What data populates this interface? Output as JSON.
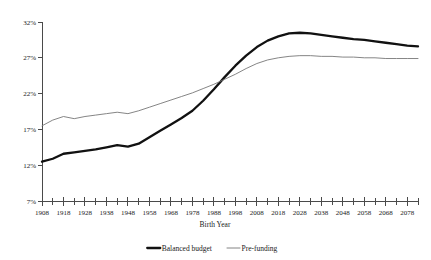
{
  "chart_data": {
    "type": "line",
    "title": "",
    "xlabel": "Birth Year",
    "ylabel": "",
    "xlim": [
      1908,
      2083
    ],
    "ylim": [
      7,
      32
    ],
    "grid": false,
    "legend_position": "bottom",
    "y_tick_labels": [
      "32%",
      "27%",
      "22%",
      "17%",
      "12%",
      "7%"
    ],
    "y_ticks": [
      32,
      27,
      22,
      17,
      12,
      7
    ],
    "x_tick_labels": [
      "1908",
      "1918",
      "1928",
      "1938",
      "1948",
      "1958",
      "1968",
      "1978",
      "1988",
      "1998",
      "2008",
      "2018",
      "2028",
      "2038",
      "2048",
      "2058",
      "2068",
      "2078"
    ],
    "x_ticks_major": [
      1908,
      1918,
      1928,
      1938,
      1948,
      1958,
      1968,
      1978,
      1988,
      1998,
      2008,
      2018,
      2028,
      2038,
      2048,
      2058,
      2068,
      2078
    ],
    "x_minor_step": 5,
    "x": [
      1908,
      1913,
      1918,
      1923,
      1928,
      1933,
      1938,
      1943,
      1948,
      1953,
      1958,
      1963,
      1968,
      1973,
      1978,
      1983,
      1988,
      1993,
      1998,
      2003,
      2008,
      2013,
      2018,
      2023,
      2028,
      2033,
      2038,
      2043,
      2048,
      2053,
      2058,
      2063,
      2068,
      2073,
      2078,
      2083
    ],
    "series": [
      {
        "name": "Balanced budget",
        "color": "#111111",
        "width": "thick",
        "values": [
          12.5,
          12.9,
          13.6,
          13.8,
          14.0,
          14.2,
          14.5,
          14.8,
          14.6,
          15.0,
          15.9,
          16.8,
          17.7,
          18.6,
          19.6,
          21.0,
          22.6,
          24.3,
          25.9,
          27.3,
          28.5,
          29.4,
          30.0,
          30.4,
          30.5,
          30.4,
          30.2,
          30.0,
          29.8,
          29.6,
          29.5,
          29.3,
          29.1,
          28.9,
          28.7,
          28.6
        ]
      },
      {
        "name": "Pre-funding",
        "color": "#777777",
        "width": "thin",
        "values": [
          17.5,
          18.3,
          18.8,
          18.5,
          18.8,
          19.0,
          19.2,
          19.4,
          19.2,
          19.6,
          20.1,
          20.6,
          21.1,
          21.6,
          22.1,
          22.7,
          23.3,
          24.0,
          24.7,
          25.5,
          26.2,
          26.7,
          27.0,
          27.2,
          27.3,
          27.3,
          27.2,
          27.2,
          27.1,
          27.1,
          27.0,
          27.0,
          26.9,
          26.9,
          26.9,
          26.9
        ]
      }
    ]
  },
  "legend": {
    "items": [
      {
        "label": "Balanced budget"
      },
      {
        "label": "Pre-funding"
      }
    ]
  },
  "axes": {
    "x_title": "Birth Year"
  }
}
